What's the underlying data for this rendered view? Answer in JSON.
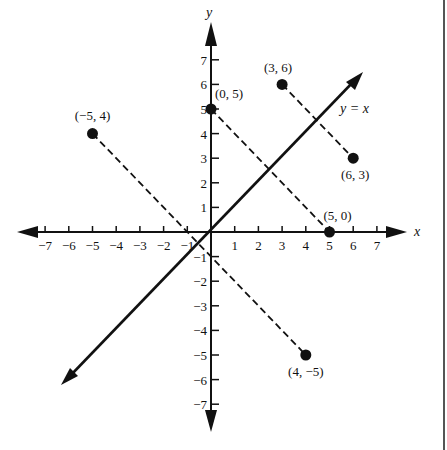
{
  "figure": {
    "x_axis": {
      "name": "x",
      "min": -7,
      "max": 7,
      "ticks": [
        -7,
        -6,
        -5,
        -4,
        -3,
        -2,
        -1,
        1,
        2,
        3,
        4,
        5,
        6,
        7
      ]
    },
    "y_axis": {
      "name": "y",
      "min": -7,
      "max": 7,
      "ticks": [
        -7,
        -6,
        -5,
        -4,
        -3,
        -2,
        -1,
        1,
        2,
        3,
        4,
        5,
        6,
        7
      ]
    },
    "line": {
      "label": "y = x"
    },
    "points": [
      {
        "label": "(0, 5)",
        "x": 0,
        "y": 5
      },
      {
        "label": "(5, 0)",
        "x": 5,
        "y": 0
      },
      {
        "label": "(3, 6)",
        "x": 3,
        "y": 6
      },
      {
        "label": "(6, 3)",
        "x": 6,
        "y": 3
      },
      {
        "label": "(−5, 4)",
        "x": -5,
        "y": 4
      },
      {
        "label": "(4, −5)",
        "x": 4,
        "y": -5
      }
    ],
    "dashed_segments": [
      {
        "from": "(0, 5)",
        "to": "(5, 0)"
      },
      {
        "from": "(3, 6)",
        "to": "(6, 3)"
      },
      {
        "from": "(−5, 4)",
        "to": "(4, −5)"
      }
    ]
  },
  "chart_data": {
    "type": "scatter",
    "title": "",
    "xlabel": "x",
    "ylabel": "y",
    "xlim": [
      -7,
      7
    ],
    "ylim": [
      -7,
      7
    ],
    "grid": false,
    "series": [
      {
        "name": "points",
        "x": [
          0,
          5,
          3,
          6,
          -5,
          4
        ],
        "y": [
          5,
          0,
          6,
          3,
          4,
          -5
        ],
        "labels": [
          "(0, 5)",
          "(5, 0)",
          "(3, 6)",
          "(6, 3)",
          "(−5, 4)",
          "(4, −5)"
        ]
      },
      {
        "name": "y = x",
        "type": "line",
        "x": [
          -6.3,
          6.4
        ],
        "y": [
          -6.3,
          6.4
        ]
      }
    ],
    "annotations": [
      "y = x"
    ]
  }
}
